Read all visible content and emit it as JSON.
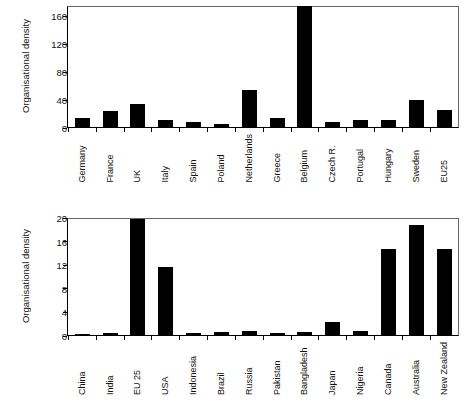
{
  "chart_data": [
    {
      "type": "bar",
      "id": "eu-countries",
      "title": "",
      "xlabel": "",
      "ylabel": "Organisational density",
      "ylim": [
        0,
        175
      ],
      "yticks": [
        0,
        40,
        80,
        120,
        160
      ],
      "grid": false,
      "legend": null,
      "bar_color": "#000000",
      "categories": [
        "Germany",
        "France",
        "UK",
        "Italy",
        "Spain",
        "Poland",
        "Netherlands",
        "Greece",
        "Belgium",
        "Czech R.",
        "Portugal",
        "Hungary",
        "Sweden",
        "EU25"
      ],
      "values": [
        12,
        23,
        33,
        10,
        7,
        4,
        53,
        12,
        175,
        7,
        9,
        10,
        39,
        24
      ]
    },
    {
      "type": "bar",
      "id": "world-countries",
      "title": "",
      "xlabel": "",
      "ylabel": "Organisational density",
      "ylim": [
        0,
        20
      ],
      "yticks": [
        0,
        4,
        8,
        12,
        16,
        20
      ],
      "grid": false,
      "legend": null,
      "bar_color": "#000000",
      "categories": [
        "China",
        "India",
        "EU 25",
        "USA",
        "Indonesia",
        "Brazil",
        "Russia",
        "Pakistan",
        "Bangladesh",
        "Japan",
        "Nigeria",
        "Canada",
        "Australia",
        "New Zealand"
      ],
      "values": [
        0.02,
        0.25,
        19.8,
        11.6,
        0.3,
        0.5,
        0.55,
        0.35,
        0.4,
        2.1,
        0.6,
        14.7,
        18.8,
        14.6
      ]
    }
  ]
}
